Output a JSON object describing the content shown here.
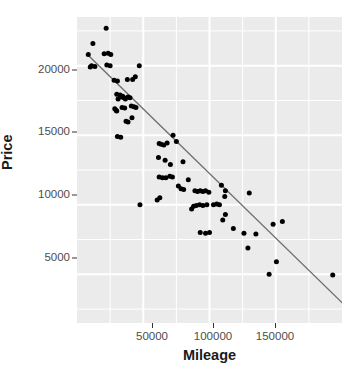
{
  "chart_data": {
    "type": "scatter",
    "title": "",
    "xlabel": "Mileage",
    "ylabel": "Price",
    "xlim": [
      0,
      200000
    ],
    "ylim": [
      1500,
      23500
    ],
    "grid": true,
    "legend": false,
    "x_ticks": [
      50000,
      100000,
      150000
    ],
    "x_tick_labels": [
      "50000",
      "100000",
      "150000"
    ],
    "y_ticks": [
      5000,
      10000,
      15000,
      20000
    ],
    "y_tick_labels": [
      "5000",
      "10000",
      "15000",
      "20000"
    ],
    "point_color": "#000000",
    "point_size": 5,
    "panel_background": "#ebebeb",
    "gridline_color": "#ffffff",
    "trend_line": {
      "type": "linear-fit",
      "color": "#6e6e6e",
      "x_start": 9000,
      "y_start": 20700,
      "x_end": 205000,
      "y_end": 2500
    },
    "series": [
      {
        "name": "cars",
        "points": [
          [
            10000,
            19900
          ],
          [
            8500,
            20800
          ],
          [
            12000,
            21600
          ],
          [
            11000,
            20000
          ],
          [
            13500,
            19950
          ],
          [
            22000,
            22700
          ],
          [
            20500,
            20850
          ],
          [
            23500,
            20900
          ],
          [
            25500,
            20800
          ],
          [
            22500,
            20050
          ],
          [
            25000,
            20000
          ],
          [
            28000,
            18950
          ],
          [
            30500,
            18900
          ],
          [
            38000,
            19000
          ],
          [
            42000,
            19000
          ],
          [
            44000,
            19200
          ],
          [
            47000,
            20000
          ],
          [
            30000,
            17950
          ],
          [
            31000,
            17600
          ],
          [
            32500,
            17900
          ],
          [
            33500,
            17750
          ],
          [
            34500,
            17800
          ],
          [
            35500,
            17700
          ],
          [
            36500,
            17600
          ],
          [
            38500,
            17750
          ],
          [
            40000,
            17700
          ],
          [
            36000,
            16950
          ],
          [
            34000,
            17000
          ],
          [
            41000,
            17100
          ],
          [
            43000,
            17050
          ],
          [
            44500,
            17000
          ],
          [
            28500,
            16900
          ],
          [
            29500,
            16800
          ],
          [
            30000,
            16750
          ],
          [
            37000,
            16000
          ],
          [
            38500,
            15950
          ],
          [
            41500,
            16250
          ],
          [
            30500,
            14900
          ],
          [
            33000,
            14850
          ],
          [
            62000,
            14400
          ],
          [
            63500,
            14350
          ],
          [
            65500,
            14300
          ],
          [
            68000,
            14450
          ],
          [
            75000,
            14550
          ],
          [
            72500,
            15000
          ],
          [
            61500,
            13400
          ],
          [
            66500,
            13200
          ],
          [
            70500,
            12900
          ],
          [
            80000,
            13100
          ],
          [
            62000,
            12000
          ],
          [
            64500,
            11950
          ],
          [
            67000,
            11950
          ],
          [
            70000,
            12050
          ],
          [
            72000,
            12000
          ],
          [
            84000,
            11800
          ],
          [
            78500,
            11150
          ],
          [
            80500,
            11100
          ],
          [
            76500,
            11350
          ],
          [
            62500,
            10500
          ],
          [
            60500,
            10350
          ],
          [
            89000,
            11000
          ],
          [
            91000,
            10950
          ],
          [
            93000,
            11000
          ],
          [
            95000,
            10950
          ],
          [
            97000,
            11000
          ],
          [
            99500,
            10900
          ],
          [
            109000,
            11400
          ],
          [
            112000,
            11000
          ],
          [
            111500,
            10600
          ],
          [
            130000,
            10850
          ],
          [
            47500,
            10000
          ],
          [
            86500,
            9700
          ],
          [
            88000,
            9900
          ],
          [
            90000,
            9950
          ],
          [
            92500,
            10000
          ],
          [
            95000,
            9950
          ],
          [
            98000,
            10000
          ],
          [
            103000,
            10000
          ],
          [
            105500,
            10050
          ],
          [
            107500,
            10000
          ],
          [
            112000,
            9300
          ],
          [
            110000,
            8900
          ],
          [
            118000,
            8300
          ],
          [
            93000,
            8000
          ],
          [
            97000,
            7950
          ],
          [
            100000,
            8000
          ],
          [
            126000,
            7950
          ],
          [
            135000,
            7900
          ],
          [
            148000,
            8600
          ],
          [
            155000,
            8800
          ],
          [
            129000,
            6900
          ],
          [
            150500,
            5900
          ],
          [
            145000,
            5000
          ],
          [
            193000,
            4950
          ]
        ]
      }
    ]
  },
  "axes": {
    "y_tick_positions": [
      258,
      195,
      132,
      70
    ],
    "x_tick_positions": [
      152,
      213,
      275
    ]
  }
}
